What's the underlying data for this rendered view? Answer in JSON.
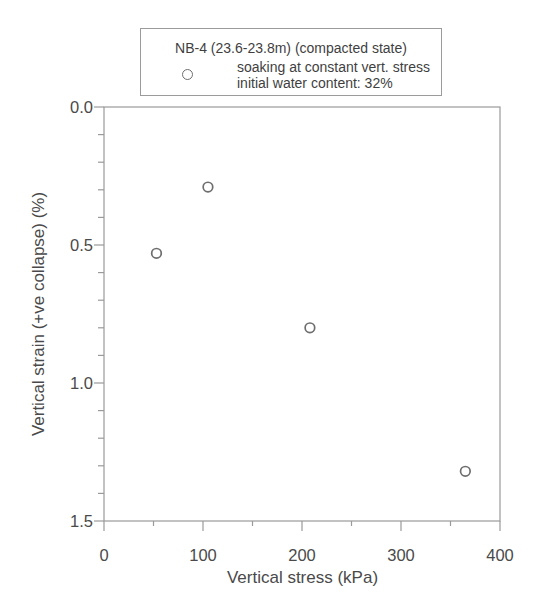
{
  "chart_data": {
    "type": "scatter",
    "title": "",
    "xlabel": "Vertical stress (kPa)",
    "ylabel": "Vertical strain (+ve collapse) (%)",
    "xlim": [
      0,
      400
    ],
    "ylim": [
      0,
      1.5
    ],
    "y_direction": "down",
    "grid": false,
    "legend_position": "top-center-above-plot",
    "x_ticks": {
      "major": [
        0,
        100,
        200,
        300,
        400
      ],
      "minor_step": 50,
      "labels": [
        "0",
        "100",
        "200",
        "300",
        "400"
      ]
    },
    "y_ticks": {
      "major": [
        0,
        0.5,
        1.0,
        1.5
      ],
      "minor_step": 0.1,
      "labels": [
        "0.0",
        "0.5",
        "1.0",
        "1.5"
      ]
    },
    "series": [
      {
        "name": "soaking at constant vert. stress, initial water content: 32%",
        "marker": "open-circle",
        "points": [
          [
            53,
            0.53
          ],
          [
            105,
            0.29
          ],
          [
            208,
            0.8
          ],
          [
            365,
            1.32
          ]
        ]
      }
    ]
  },
  "legend": {
    "title": "NB-4 (23.6-23.8m) (compacted state)",
    "entry_line1": "soaking at constant vert. stress",
    "entry_line2": "initial water content: 32%",
    "marker_icon": "open-circle"
  },
  "colors": {
    "background": "#ffffff",
    "axis": "#9a9a9a",
    "text": "#4a4a4a",
    "marker": "#6e6e6e",
    "legend_border": "#9b9b9b"
  }
}
